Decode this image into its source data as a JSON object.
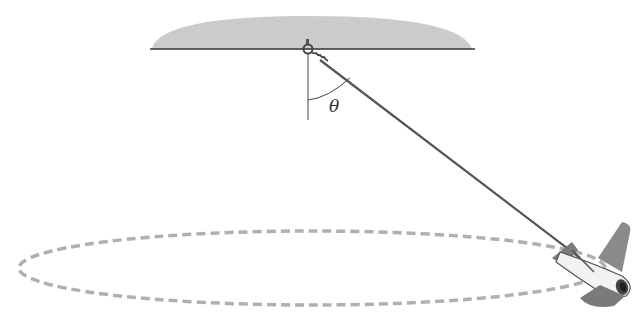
{
  "diagram": {
    "type": "conical-pendulum",
    "labels": {
      "angle": "θ"
    },
    "elements": [
      "ceiling",
      "pivot-ring",
      "string",
      "vertical-reference-line",
      "angle-arc",
      "circular-path",
      "toy-airplane"
    ],
    "colors": {
      "ceiling": "#bdbdbd",
      "string": "#555555",
      "path": "#b0b0b0",
      "plane_wing": "#7a7a7a",
      "plane_body": "#f2f2f2"
    }
  }
}
